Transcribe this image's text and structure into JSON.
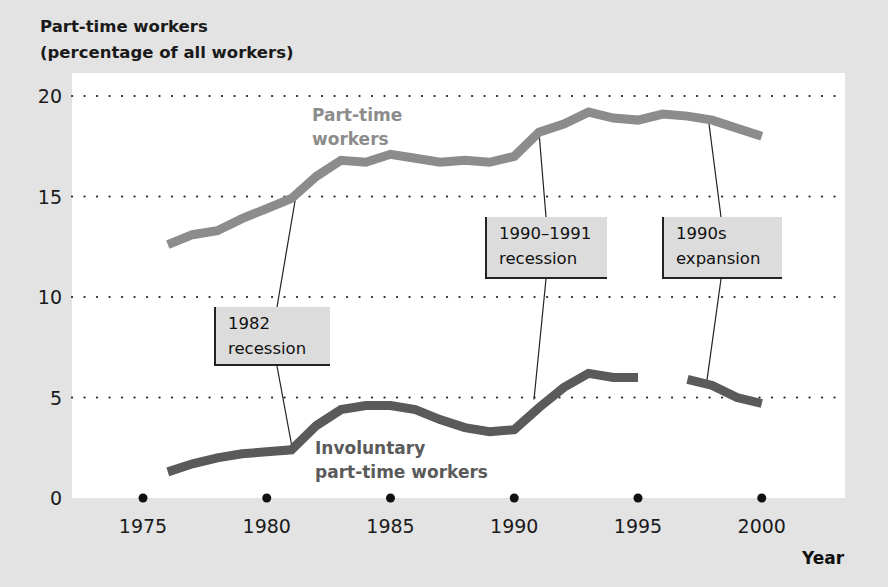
{
  "chart_data": {
    "type": "line",
    "title": "Part-time workers (percentage of all workers)",
    "title_lines": [
      "Part-time workers",
      "(percentage of all workers)"
    ],
    "xlabel": "Year",
    "ylabel": "Part-time workers (percentage of all workers)",
    "ylim": [
      0,
      20
    ],
    "xlim": [
      1973,
      2003
    ],
    "y_ticks": [
      "0",
      "5",
      "10",
      "15",
      "20"
    ],
    "x_ticks": [
      "1975",
      "1980",
      "1985",
      "1990",
      "1995",
      "2000"
    ],
    "grid": "dotted horizontal at 5, 10, 15, 20",
    "series": [
      {
        "name": "Part-time workers",
        "color": "#8c8c8c",
        "x": [
          1976,
          1977,
          1978,
          1979,
          1980,
          1981,
          1982,
          1983,
          1984,
          1985,
          1986,
          1987,
          1988,
          1989,
          1990,
          1991,
          1992,
          1993,
          1994,
          1995,
          1996,
          1997,
          1998,
          1999,
          2000
        ],
        "values": [
          12.6,
          13.1,
          13.3,
          13.9,
          14.4,
          14.9,
          16.0,
          16.8,
          16.7,
          17.1,
          16.9,
          16.7,
          16.8,
          16.7,
          17.0,
          18.2,
          18.6,
          19.2,
          18.9,
          18.8,
          19.1,
          19.0,
          18.8,
          18.4,
          18.0
        ]
      },
      {
        "name": "Involuntary part-time workers",
        "color": "#5a5a5a",
        "x": [
          1976,
          1977,
          1978,
          1979,
          1980,
          1981,
          1982,
          1983,
          1984,
          1985,
          1986,
          1987,
          1988,
          1989,
          1990,
          1991,
          1992,
          1993,
          1994,
          1995,
          null,
          1997,
          1998,
          1999,
          2000
        ],
        "values": [
          1.3,
          1.7,
          2.0,
          2.2,
          2.3,
          2.4,
          3.6,
          4.4,
          4.6,
          4.6,
          4.4,
          3.9,
          3.5,
          3.3,
          3.4,
          4.5,
          5.5,
          6.2,
          6.0,
          6.0,
          null,
          5.9,
          5.6,
          5.0,
          4.7
        ]
      }
    ],
    "annotations": [
      {
        "text_lines": [
          "1982",
          "recession"
        ],
        "year": 1981
      },
      {
        "text_lines": [
          "1990–1991",
          "recession"
        ],
        "year": 1991
      },
      {
        "text_lines": [
          "1990s",
          "expansion"
        ],
        "year": 1998
      }
    ],
    "series_labels": {
      "part_time": [
        "Part-time",
        "workers"
      ],
      "involuntary": [
        "Involuntary",
        "part-time workers"
      ]
    }
  }
}
